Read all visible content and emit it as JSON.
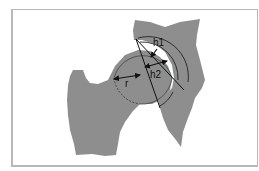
{
  "diagram": {
    "type": "anatomical-diagram",
    "labels": {
      "h1": "h1",
      "h2": "h2",
      "r": "r"
    },
    "colors": {
      "bone_fill": "#8e8e8e",
      "line": "#111111",
      "frame": "#b8b8b8",
      "background": "#ffffff"
    }
  }
}
